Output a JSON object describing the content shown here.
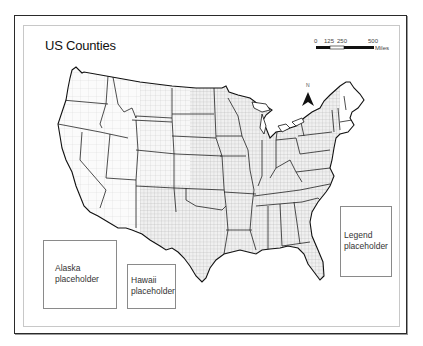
{
  "map": {
    "title": "US Counties",
    "scale_bar": {
      "ticks": [
        "0",
        "125",
        "250",
        "500"
      ],
      "unit": "Miles"
    },
    "north_arrow": {
      "label": "N",
      "icon": "north-arrow-icon"
    },
    "placeholders": {
      "alaska": {
        "line1": "Alaska",
        "line2": "placeholder"
      },
      "hawaii": {
        "line1": "Hawaii",
        "line2": "placeholder"
      },
      "legend": {
        "line1": "Legend",
        "line2": "placeholder"
      }
    },
    "colors": {
      "frame": "#2a2a2a",
      "state_border": "#222222",
      "county_border": "#b5b5b5",
      "land": "#f4f4f4"
    }
  }
}
